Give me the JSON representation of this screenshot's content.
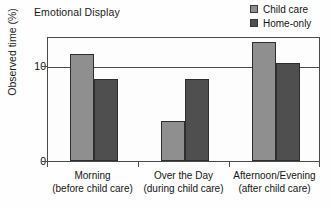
{
  "chart_data": {
    "type": "bar",
    "title": "Emotional Display",
    "xlabel": "",
    "ylabel": "Observed time (%)",
    "ylim": [
      0,
      13.2
    ],
    "yticks": [
      0,
      10
    ],
    "ytick_labels": [
      "0",
      "10"
    ],
    "grid": true,
    "legend_position": "top-right",
    "categories": [
      "Morning\n(before child care)",
      "Over the Day\n(during child care)",
      "Afternoon/Evening\n(after child care)"
    ],
    "category_lines": [
      {
        "line1": "Morning",
        "line2": "(before child care)"
      },
      {
        "line1": "Over the Day",
        "line2": "(during child care)"
      },
      {
        "line1": "Afternoon/Evening",
        "line2": "(after child care)"
      }
    ],
    "series": [
      {
        "name": "Child care",
        "color": "#8f8f8f",
        "values": [
          11.3,
          4.2,
          12.6
        ]
      },
      {
        "name": "Home-only",
        "color": "#4f4f4f",
        "values": [
          8.7,
          8.7,
          10.4
        ]
      }
    ]
  },
  "legend": {
    "items": [
      {
        "label": "Child care",
        "color": "#8f8f8f"
      },
      {
        "label": "Home-only",
        "color": "#4f4f4f"
      }
    ]
  },
  "axes": {
    "y_label": "Observed time (%)",
    "y_tick_0": "0",
    "y_tick_10": "10"
  }
}
